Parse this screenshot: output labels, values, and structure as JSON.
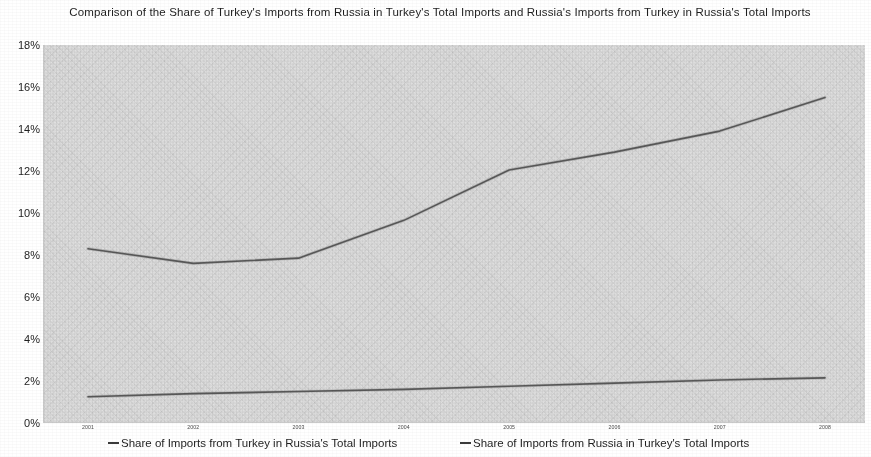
{
  "chart_data": {
    "type": "line",
    "title": "Comparison of the Share of Turkey's Imports from Russia in Turkey's Total Imports and Russia's Imports from Turkey in Russia's Total Imports",
    "xlabel": "",
    "ylabel": "",
    "ylim": [
      0,
      18
    ],
    "ytick_labels": [
      "18%",
      "16%",
      "14%",
      "12%",
      "10%",
      "8%",
      "6%",
      "4%",
      "2%",
      "0%"
    ],
    "ytick_values": [
      18,
      16,
      14,
      12,
      10,
      8,
      6,
      4,
      2,
      0
    ],
    "categories": [
      "2001",
      "2002",
      "2003",
      "2004",
      "2005",
      "2006",
      "2007",
      "2008"
    ],
    "grid": false,
    "legend_position": "bottom",
    "series": [
      {
        "name": "Share of Imports from Turkey in Russia's Total Imports",
        "values": [
          1.25,
          1.4,
          1.5,
          1.6,
          1.75,
          1.9,
          2.05,
          2.15
        ],
        "color": "#4f4f4f"
      },
      {
        "name": "Share of Imports from Russia in Turkey's Total Imports",
        "values": [
          8.3,
          7.6,
          7.85,
          9.65,
          12.05,
          12.9,
          13.9,
          15.5
        ],
        "color": "#4f4f4f"
      }
    ]
  },
  "legend": {
    "items": [
      {
        "label": "Share of Imports from Turkey in Russia's Total Imports"
      },
      {
        "label": "Share of Imports from Russia in Turkey's Total Imports"
      }
    ]
  }
}
